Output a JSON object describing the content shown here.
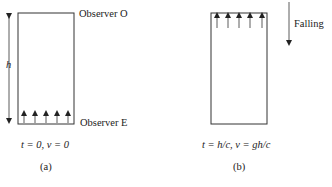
{
  "panel_a": {
    "observer_top": "Observer O",
    "observer_bottom": "Observer E",
    "height_label": "h",
    "condition": "t = 0, v = 0",
    "caption": "(a)"
  },
  "panel_b": {
    "falling_label": "Falling",
    "condition": "t = h/c, v = gh/c",
    "caption": "(b)"
  }
}
